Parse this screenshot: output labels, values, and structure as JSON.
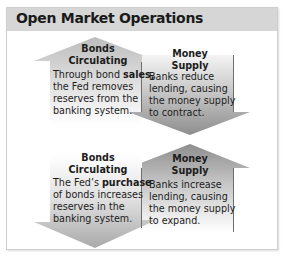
{
  "title": "Open Market Operations",
  "panels": [
    {
      "name": "sale",
      "left": {
        "heading_line1": "Bonds",
        "heading_line2": "Circulating",
        "arrow_direction": "up",
        "body_pre": "Through bond ",
        "body_bold": "sales,",
        "body_line2": "the Fed removes",
        "body_line3": "reserves from the",
        "body_line4": "banking system."
      },
      "right": {
        "heading_line1": "Money",
        "heading_line2": "Supply",
        "arrow_direction": "down",
        "body_line1": "Banks reduce",
        "body_line2": "lending, causing",
        "body_line3": "the money supply",
        "body_line4": "to contract."
      }
    },
    {
      "name": "purchase",
      "left": {
        "heading_line1": "Bonds",
        "heading_line2": "Circulating",
        "arrow_direction": "down",
        "body_pre": "The Fed’s ",
        "body_bold": "purchase",
        "body_line2": "of bonds increases",
        "body_line3": "reserves in the",
        "body_line4": "banking system."
      },
      "right": {
        "heading_line1": "Money",
        "heading_line2": "Supply",
        "arrow_direction": "up",
        "body_line1": "Banks increase",
        "body_line2": "lending, causing",
        "body_line3": "the money supply",
        "body_line4": "to expand."
      }
    }
  ],
  "colors": {
    "header_bg": "#d6d6d6",
    "arrow_light": "#d9d9d9",
    "arrow_dark": "#9a9a9a"
  }
}
